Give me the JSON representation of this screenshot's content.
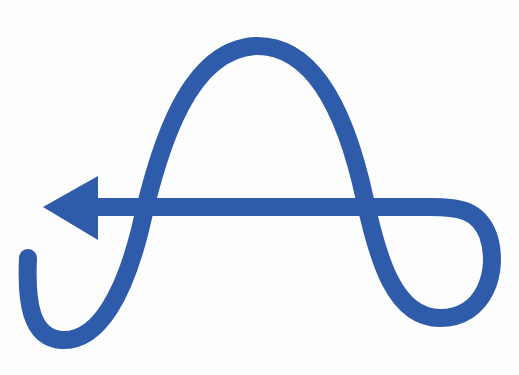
{
  "symbol": {
    "name": "looping-arrow-a-symbol",
    "stroke_color": "#2E5BAA",
    "background": "#FDFDFD",
    "stroke_width": 18,
    "description": "Blue continuous line forming an A-shaped loop ending in a left-pointing arrow"
  }
}
